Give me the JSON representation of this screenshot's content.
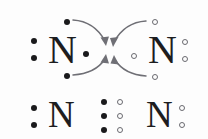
{
  "figure": {
    "background_color": "#fdfdfd",
    "filled_electron_color": "#1a1a1c",
    "open_electron_color": "#6a6a70",
    "arrow_color": "#6f6f75",
    "atom_color": "#1d1d1f"
  },
  "rows": [
    {
      "id": "reactants",
      "description": "Two separate nitrogen atoms with unpaired electrons and curved arrows showing electron pairing",
      "atoms": [
        {
          "id": "left-nitrogen-top",
          "symbol": "N",
          "x": 48,
          "y": 30,
          "electrons": [
            {
              "id": "lone-pair-left-upper",
              "style": "filled",
              "x": 31,
              "y": 38
            },
            {
              "id": "lone-pair-left-lower",
              "style": "filled",
              "x": 31,
              "y": 55
            },
            {
              "id": "unpaired-top",
              "style": "filled",
              "x": 64,
              "y": 19
            },
            {
              "id": "unpaired-bottom",
              "style": "filled",
              "x": 64,
              "y": 73
            },
            {
              "id": "unpaired-right",
              "style": "filled",
              "x": 83,
              "y": 51
            }
          ]
        },
        {
          "id": "right-nitrogen-top",
          "symbol": "N",
          "x": 148,
          "y": 30,
          "electrons": [
            {
              "id": "lone-pair-right-upper",
              "style": "open",
              "x": 182,
              "y": 39
            },
            {
              "id": "lone-pair-right-lower",
              "style": "open",
              "x": 182,
              "y": 56
            },
            {
              "id": "unpaired-top",
              "style": "open",
              "x": 152,
              "y": 19
            },
            {
              "id": "unpaired-bottom",
              "style": "open",
              "x": 152,
              "y": 74
            },
            {
              "id": "unpaired-left",
              "style": "open",
              "x": 131,
              "y": 53
            }
          ]
        }
      ],
      "arrows": [
        {
          "id": "arrow-top-left-to-center",
          "from": "left-unpaired-top",
          "to": "bond-region",
          "d": "M 73 20 C 89 22 98 31 104 43",
          "head": "104,45 100,37 108,38"
        },
        {
          "id": "arrow-top-right-to-center",
          "from": "right-unpaired-top",
          "to": "bond-region",
          "d": "M 145 21 C 130 23 121 32 115 44",
          "head": "115,46 111,38 119,37"
        },
        {
          "id": "arrow-bottom-left-to-center",
          "from": "left-unpaired-bottom",
          "to": "bond-region",
          "d": "M 73 74 C 89 72 98 66 104 58",
          "head": "104,56 99,64 107,65"
        },
        {
          "id": "arrow-bottom-right-to-center",
          "from": "right-unpaired-bottom",
          "to": "bond-region",
          "d": "M 145 74 C 131 72 122 66 116 58",
          "head": "116,56 112,65 120,64"
        }
      ]
    },
    {
      "id": "product",
      "description": "Nitrogen molecule with a triple bond: three shared electron pairs drawn as three filled dots and three open circles between the atoms",
      "atoms": [
        {
          "id": "left-nitrogen-bottom",
          "symbol": "N",
          "x": 48,
          "y": 96,
          "electrons": [
            {
              "id": "lone-pair-left-upper",
              "style": "filled",
              "x": 31,
              "y": 105
            },
            {
              "id": "lone-pair-left-lower",
              "style": "filled",
              "x": 31,
              "y": 122
            }
          ]
        },
        {
          "id": "right-nitrogen-bottom",
          "symbol": "N",
          "x": 146,
          "y": 96,
          "electrons": [
            {
              "id": "lone-pair-right-upper",
              "style": "open",
              "x": 179,
              "y": 105
            },
            {
              "id": "lone-pair-right-lower",
              "style": "open",
              "x": 179,
              "y": 122
            }
          ]
        }
      ],
      "bond": {
        "id": "triple-bond",
        "bond_order": 3,
        "shared_electron_count": 6,
        "filled_column": [
          {
            "id": "bond-filled-top",
            "style": "filled",
            "x": 101,
            "y": 99
          },
          {
            "id": "bond-filled-middle",
            "style": "filled",
            "x": 101,
            "y": 113
          },
          {
            "id": "bond-filled-bottom",
            "style": "filled",
            "x": 101,
            "y": 127
          }
        ],
        "open_column": [
          {
            "id": "bond-open-top",
            "style": "open",
            "x": 117,
            "y": 99
          },
          {
            "id": "bond-open-middle",
            "style": "open",
            "x": 117,
            "y": 113
          },
          {
            "id": "bond-open-bottom",
            "style": "open",
            "x": 117,
            "y": 127
          }
        ]
      }
    }
  ]
}
